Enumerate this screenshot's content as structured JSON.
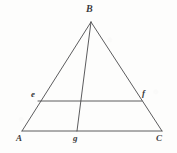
{
  "figure": {
    "background_color": "#fdfdfc",
    "stroke_color": "#4a4a4c",
    "label_color": "#3a3a3c",
    "stroke_width": 0.9,
    "width": 177,
    "height": 153,
    "points": {
      "B": {
        "label": "B",
        "x": 91,
        "y": 22
      },
      "A": {
        "label": "A",
        "x": 22,
        "y": 131
      },
      "C": {
        "label": "C",
        "x": 162,
        "y": 131
      },
      "e": {
        "label": "e",
        "x": 38,
        "y": 101
      },
      "f": {
        "label": "f",
        "x": 142,
        "y": 101
      },
      "g": {
        "label": "g",
        "x": 77,
        "y": 131
      }
    },
    "segments": [
      {
        "name": "side-AB",
        "from": "A",
        "to": "B"
      },
      {
        "name": "side-BC",
        "from": "B",
        "to": "C"
      },
      {
        "name": "base-AC",
        "from": "A",
        "to": "C"
      },
      {
        "name": "midsegment-ef",
        "from": "e",
        "to": "f"
      },
      {
        "name": "cevian-Bg",
        "from": "B",
        "to": "g"
      }
    ]
  }
}
